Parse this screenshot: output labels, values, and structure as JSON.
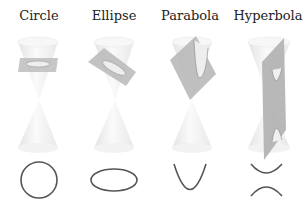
{
  "sections": [
    {
      "label": "Circle",
      "curve": "circle"
    },
    {
      "label": "Ellipse",
      "curve": "ellipse"
    },
    {
      "label": "Parabola",
      "curve": "parabola"
    },
    {
      "label": "Hyperbola",
      "curve": "hyperbola"
    }
  ],
  "colors": {
    "cone": "#f2f2f2",
    "cone_edge": "#e0e0e0",
    "plane": "#b5b5b5",
    "curve": "#555555"
  }
}
